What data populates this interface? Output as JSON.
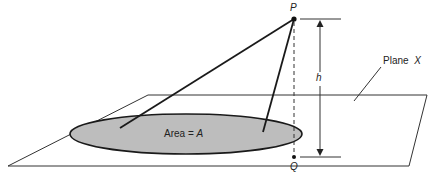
{
  "diagram": {
    "type": "geometry",
    "labels": {
      "apex": "P",
      "foot": "Q",
      "height": "h",
      "plane_name": "Plane",
      "plane_var": "X",
      "area_text": "Area = ",
      "area_var": "A"
    },
    "colors": {
      "stroke": "#1a1a1a",
      "plane_stroke": "#333333",
      "ellipse_fill": "#bdbdbd",
      "background": "#ffffff"
    },
    "geometry": {
      "P": [
        294,
        19
      ],
      "Q": [
        294,
        157
      ],
      "plane": [
        [
          148,
          95
        ],
        [
          427,
          95
        ],
        [
          409,
          166
        ],
        [
          8,
          166
        ]
      ],
      "ellipse": {
        "cx": 186,
        "cy": 134,
        "rx": 116,
        "ry": 20
      },
      "height_arrow_x": 320
    }
  }
}
